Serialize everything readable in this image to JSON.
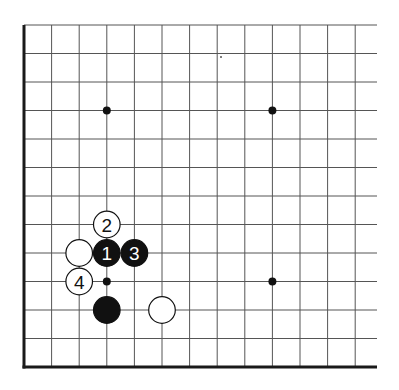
{
  "diagram": {
    "type": "go-board-fragment",
    "visible_columns": 13,
    "visible_rows": 13,
    "edges": [
      "left",
      "bottom"
    ],
    "colors": {
      "line": "#555555",
      "edge": "#1a1a1a",
      "black": "#111111",
      "white": "#ffffff"
    },
    "star_points": [
      {
        "col": 3,
        "row": 3
      },
      {
        "col": 9,
        "row": 3
      },
      {
        "col": 3,
        "row": 9
      },
      {
        "col": 9,
        "row": 9
      }
    ],
    "stones": [
      {
        "color": "white",
        "col": 3,
        "row": 5,
        "label": "2"
      },
      {
        "color": "white",
        "col": 2,
        "row": 4,
        "label": ""
      },
      {
        "color": "black",
        "col": 3,
        "row": 4,
        "label": "1"
      },
      {
        "color": "black",
        "col": 4,
        "row": 4,
        "label": "3"
      },
      {
        "color": "white",
        "col": 2,
        "row": 3,
        "label": "4"
      },
      {
        "color": "black",
        "col": 3,
        "row": 2,
        "label": ""
      },
      {
        "color": "white",
        "col": 5,
        "row": 2,
        "label": ""
      }
    ]
  }
}
